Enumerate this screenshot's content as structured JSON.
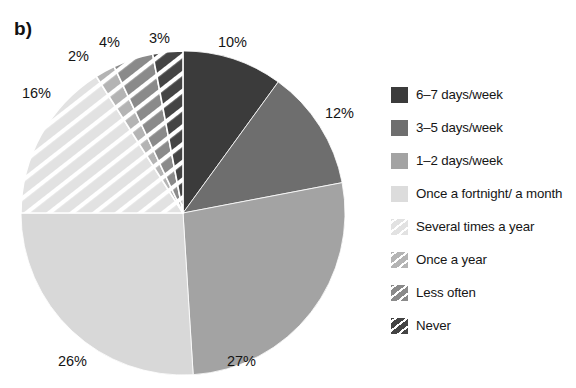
{
  "figure": {
    "panel_label": "b)",
    "background_color": "#ffffff"
  },
  "chart_data": {
    "type": "pie",
    "title": "b)",
    "xlabel": "",
    "ylabel": "",
    "categories": [
      "6–7 days/week",
      "3–5 days/week",
      "1–2 days/week",
      "Once a fortnight/ a month",
      "Several times a year",
      "Once a year",
      "Less often",
      "Never"
    ],
    "values": [
      10,
      12,
      27,
      26,
      16,
      2,
      4,
      3
    ],
    "value_labels": [
      "10%",
      "12%",
      "27%",
      "26%",
      "16%",
      "2%",
      "4%",
      "3%"
    ],
    "colors": [
      "#3b3b3b",
      "#6e6e6e",
      "#a3a3a3",
      "#d8d8d8",
      "#e2e2e2",
      "#b4b4b4",
      "#8a8a8a",
      "#444444"
    ],
    "hatched": [
      false,
      false,
      false,
      false,
      true,
      true,
      true,
      true
    ],
    "hatch_color": "#ffffff",
    "start_angle_deg": 0,
    "direction": "clockwise",
    "legend_position": "right",
    "grid": false
  },
  "pie": {
    "center_x": 183,
    "center_y": 213,
    "radius": 162,
    "slices": [
      {
        "name": "6-7 days/week",
        "percent_label": "10%",
        "value": 10,
        "color": "#3b3b3b",
        "hatched": false,
        "label_x": 218,
        "label_y": 34
      },
      {
        "name": "3-5 days/week",
        "percent_label": "12%",
        "value": 12,
        "color": "#6e6e6e",
        "hatched": false,
        "label_x": 325,
        "label_y": 105
      },
      {
        "name": "1-2 days/week",
        "percent_label": "27%",
        "value": 27,
        "color": "#a3a3a3",
        "hatched": false,
        "label_x": 227,
        "label_y": 353
      },
      {
        "name": "Once a fortnight/ a month",
        "percent_label": "26%",
        "value": 26,
        "color": "#d8d8d8",
        "hatched": false,
        "label_x": 58,
        "label_y": 353
      },
      {
        "name": "Several times a year",
        "percent_label": "16%",
        "value": 16,
        "color": "#e2e2e2",
        "hatched": true,
        "label_x": 22,
        "label_y": 85
      },
      {
        "name": "Once a year",
        "percent_label": "2%",
        "value": 2,
        "color": "#b4b4b4",
        "hatched": true,
        "label_x": 68,
        "label_y": 48
      },
      {
        "name": "Less often",
        "percent_label": "4%",
        "value": 4,
        "color": "#8a8a8a",
        "hatched": true,
        "label_x": 99,
        "label_y": 34
      },
      {
        "name": "Never",
        "percent_label": "3%",
        "value": 3,
        "color": "#444444",
        "hatched": true,
        "label_x": 149,
        "label_y": 30
      }
    ]
  },
  "legend": {
    "items": [
      {
        "label": "6–7 days/week",
        "color": "#3b3b3b",
        "hatched": false
      },
      {
        "label": "3–5 days/week",
        "color": "#6e6e6e",
        "hatched": false
      },
      {
        "label": "1–2 days/week",
        "color": "#a3a3a3",
        "hatched": false
      },
      {
        "label": "Once a fortnight/ a month",
        "color": "#dcdcdc",
        "hatched": false
      },
      {
        "label": "Several times a year",
        "color": "#e2e2e2",
        "hatched": true
      },
      {
        "label": "Once a year",
        "color": "#b4b4b4",
        "hatched": true
      },
      {
        "label": "Less often",
        "color": "#8a8a8a",
        "hatched": true
      },
      {
        "label": "Never",
        "color": "#444444",
        "hatched": true
      }
    ]
  }
}
